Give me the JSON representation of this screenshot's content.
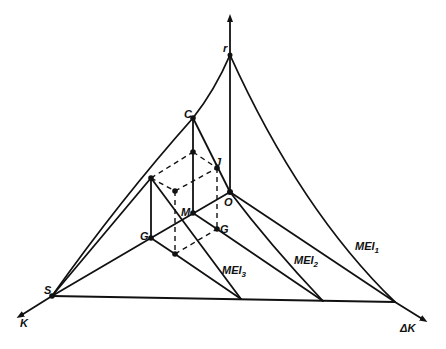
{
  "figure": {
    "type": "geometric-diagram",
    "axes": {
      "vertical": "r",
      "left": "K",
      "right": "ΔK"
    },
    "points": {
      "C": "C",
      "J": "J",
      "M": "M",
      "O": "O",
      "G_left": "G",
      "G_right": "G",
      "S": "S",
      "r": "r"
    },
    "curves": {
      "MEI1": {
        "base": "MEI",
        "sub": "1"
      },
      "MEI2": {
        "base": "MEI",
        "sub": "2"
      },
      "MEI3": {
        "base": "MEI",
        "sub": "3"
      }
    }
  }
}
